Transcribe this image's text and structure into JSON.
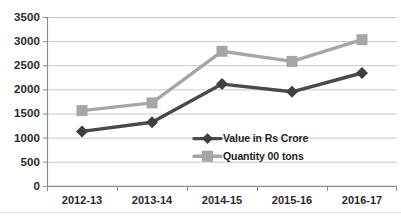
{
  "chart_data": {
    "type": "line",
    "title": "",
    "subtitle": "",
    "xlabel": "",
    "ylabel": "",
    "categories": [
      "2012-13",
      "2013-14",
      "2014-15",
      "2015-16",
      "2016-17"
    ],
    "series": [
      {
        "name": "Value in Rs Crore",
        "values": [
          1140,
          1330,
          2120,
          1960,
          2350
        ],
        "color": "#4a4a4a",
        "marker": "diamond"
      },
      {
        "name": "Quantity 00 tons",
        "values": [
          1570,
          1730,
          2800,
          2590,
          3040
        ],
        "color": "#a6a6a6",
        "marker": "square"
      }
    ],
    "ylim": [
      0,
      3500
    ],
    "yticks": [
      0,
      500,
      1000,
      1500,
      2000,
      2500,
      3000,
      3500
    ],
    "ytick_labels": [
      "0",
      "500",
      "1000",
      "1500",
      "2000",
      "2500",
      "3000",
      "3500"
    ],
    "grid": true,
    "grid_axis": "y",
    "legend_position": "inside-lower-center",
    "legend_entries": [
      "Value in Rs Crore",
      "Quantity 00 tons"
    ]
  },
  "axes": {
    "y_axis_line_color": "#808080",
    "x_axis_line_color": "#808080",
    "gridline_color": "#c9c9c9"
  }
}
